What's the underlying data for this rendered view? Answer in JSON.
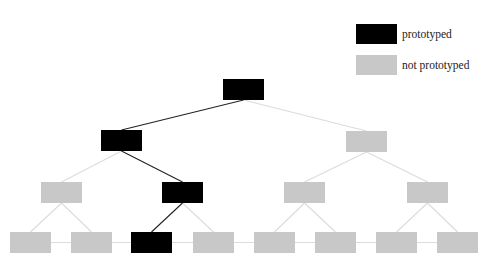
{
  "legend": {
    "items": [
      {
        "label": "prototyped",
        "color": "#000000"
      },
      {
        "label": "not prototyped",
        "color": "#c8c8c8"
      }
    ]
  },
  "colors": {
    "prototyped": "#000000",
    "not_prototyped": "#c8c8c8",
    "edge_prototyped": "#222222",
    "edge_default": "#dcdcdc"
  },
  "tree": {
    "box_width": 41,
    "box_height": 21,
    "nodes": [
      {
        "id": "root",
        "x": 223,
        "y": 79,
        "prototyped": true
      },
      {
        "id": "L",
        "x": 101,
        "y": 130,
        "prototyped": true
      },
      {
        "id": "R",
        "x": 346,
        "y": 131,
        "prototyped": false
      },
      {
        "id": "LL",
        "x": 41,
        "y": 182,
        "prototyped": false
      },
      {
        "id": "LR",
        "x": 162,
        "y": 182,
        "prototyped": true
      },
      {
        "id": "RL",
        "x": 284,
        "y": 182,
        "prototyped": false
      },
      {
        "id": "RR",
        "x": 407,
        "y": 182,
        "prototyped": false
      },
      {
        "id": "LLL",
        "x": 10,
        "y": 232,
        "prototyped": false
      },
      {
        "id": "LLR",
        "x": 71,
        "y": 232,
        "prototyped": false
      },
      {
        "id": "LRL",
        "x": 131,
        "y": 232,
        "prototyped": true
      },
      {
        "id": "LRR",
        "x": 193,
        "y": 232,
        "prototyped": false
      },
      {
        "id": "RLL",
        "x": 254,
        "y": 232,
        "prototyped": false
      },
      {
        "id": "RLR",
        "x": 315,
        "y": 232,
        "prototyped": false
      },
      {
        "id": "RRL",
        "x": 376,
        "y": 232,
        "prototyped": false
      },
      {
        "id": "RRR",
        "x": 437,
        "y": 232,
        "prototyped": false
      }
    ],
    "edges": [
      {
        "from": "root",
        "to": "L",
        "prototyped": true
      },
      {
        "from": "root",
        "to": "R",
        "prototyped": false
      },
      {
        "from": "L",
        "to": "LL",
        "prototyped": false
      },
      {
        "from": "L",
        "to": "LR",
        "prototyped": true
      },
      {
        "from": "R",
        "to": "RL",
        "prototyped": false
      },
      {
        "from": "R",
        "to": "RR",
        "prototyped": false
      },
      {
        "from": "LL",
        "to": "LLL",
        "prototyped": false
      },
      {
        "from": "LL",
        "to": "LLR",
        "prototyped": false
      },
      {
        "from": "LR",
        "to": "LRL",
        "prototyped": true
      },
      {
        "from": "LR",
        "to": "LRR",
        "prototyped": false
      },
      {
        "from": "RL",
        "to": "RLL",
        "prototyped": false
      },
      {
        "from": "RL",
        "to": "RLR",
        "prototyped": false
      },
      {
        "from": "RR",
        "to": "RRL",
        "prototyped": false
      },
      {
        "from": "RR",
        "to": "RRR",
        "prototyped": false
      }
    ],
    "leaf_row_line": true
  }
}
